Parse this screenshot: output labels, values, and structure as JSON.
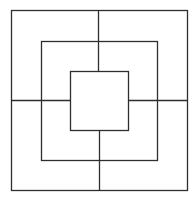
{
  "diagram": {
    "type": "concentric-squares-board",
    "background": "#ffffff",
    "stroke_color": "#2e2e2e",
    "stroke_width": 1.3,
    "squares": [
      {
        "name": "outer-square",
        "x1": 11.5,
        "y1": 10.5,
        "x2": 187.5,
        "y2": 190.5
      },
      {
        "name": "middle-square",
        "x1": 41.5,
        "y1": 41.5,
        "x2": 157.5,
        "y2": 160.5
      },
      {
        "name": "inner-square",
        "x1": 70.5,
        "y1": 71.5,
        "x2": 128.5,
        "y2": 130.5
      }
    ],
    "connectors": [
      {
        "name": "top-connector",
        "x1": 98.5,
        "y1": 10.5,
        "x2": 98.5,
        "y2": 71.5
      },
      {
        "name": "bottom-connector",
        "x1": 99.5,
        "y1": 130.5,
        "x2": 99.5,
        "y2": 190.5
      },
      {
        "name": "left-connector",
        "x1": 11.5,
        "y1": 100.5,
        "x2": 70.5,
        "y2": 100.5
      },
      {
        "name": "right-connector",
        "x1": 128.5,
        "y1": 100.5,
        "x2": 187.5,
        "y2": 100.5
      }
    ]
  }
}
